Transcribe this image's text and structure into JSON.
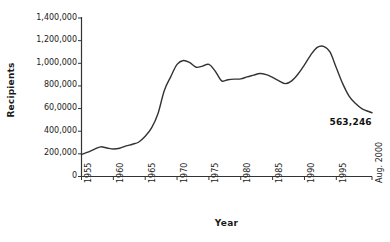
{
  "chart_data": {
    "type": "line",
    "title": "",
    "subtitle": "",
    "xlabel": "Year",
    "ylabel": "Recipients",
    "grid": false,
    "legend": "none",
    "line_color": "#333333",
    "background_color": "#ffffff",
    "xlim": [
      1955,
      2000.6
    ],
    "ylim": [
      0,
      1400000
    ],
    "y_ticks": [
      0,
      200000,
      400000,
      600000,
      800000,
      1000000,
      1200000,
      1400000
    ],
    "y_tick_labels": [
      "0",
      "200,000",
      "400,000",
      "60,0000",
      "800,000",
      "1,000,000",
      "1,200,000",
      "1,400,000"
    ],
    "x_ticks": [
      1955,
      1960,
      1965,
      1970,
      1975,
      1980,
      1985,
      1990,
      1995,
      2000.6
    ],
    "x_tick_labels": [
      "1955",
      "1960",
      "1965",
      "1970",
      "1975",
      "1980",
      "1985",
      "1990",
      "1995",
      "Aug. 2000"
    ],
    "annotations": [
      {
        "text": "563,246",
        "x": 1998.0,
        "y": 470000
      }
    ],
    "series": [
      {
        "name": "Recipients",
        "x": [
          1955,
          1956,
          1957,
          1958,
          1959,
          1960,
          1961,
          1962,
          1963,
          1964,
          1965,
          1966,
          1967,
          1968,
          1969,
          1970,
          1971,
          1972,
          1973,
          1974,
          1975,
          1976,
          1977,
          1978,
          1979,
          1980,
          1981,
          1982,
          1983,
          1984,
          1985,
          1986,
          1987,
          1988,
          1989,
          1990,
          1991,
          1992,
          1993,
          1994,
          1995,
          1996,
          1997,
          1998,
          1999,
          2000.6
        ],
        "y": [
          195000,
          215000,
          240000,
          262000,
          252000,
          243000,
          250000,
          270000,
          285000,
          305000,
          355000,
          430000,
          555000,
          760000,
          880000,
          990000,
          1025000,
          1005000,
          965000,
          975000,
          990000,
          930000,
          845000,
          855000,
          860000,
          862000,
          880000,
          895000,
          910000,
          900000,
          875000,
          845000,
          820000,
          845000,
          905000,
          985000,
          1075000,
          1140000,
          1150000,
          1100000,
          960000,
          820000,
          710000,
          645000,
          600000,
          563246
        ]
      }
    ]
  }
}
